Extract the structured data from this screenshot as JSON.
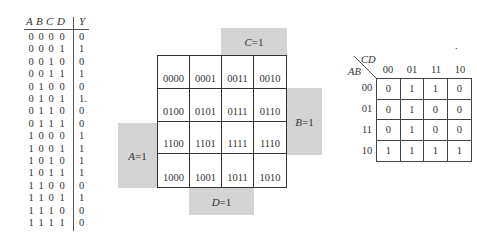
{
  "truth_table": {
    "headers": [
      "A",
      "B",
      "C",
      "D",
      "Y"
    ],
    "rows": [
      [
        "0",
        "0",
        "0",
        "0",
        "0"
      ],
      [
        "0",
        "0",
        "0",
        "1",
        "1"
      ],
      [
        "0",
        "0",
        "1",
        "0",
        "0"
      ],
      [
        "0",
        "0",
        "1",
        "1",
        "1"
      ],
      [
        "0",
        "1",
        "0",
        "0",
        "0"
      ],
      [
        "0",
        "1",
        "0",
        "1",
        "1."
      ],
      [
        "0",
        "1",
        "1",
        "0",
        "0"
      ],
      [
        "0",
        "1",
        "1",
        "1",
        "0"
      ],
      [
        "1",
        "0",
        "0",
        "0",
        "1"
      ],
      [
        "1",
        "0",
        "0",
        "1",
        "1"
      ],
      [
        "1",
        "0",
        "1",
        "0",
        "1"
      ],
      [
        "1",
        "0",
        "1",
        "1",
        "1"
      ],
      [
        "1",
        "1",
        "0",
        "0",
        "0"
      ],
      [
        "1",
        "1",
        "0",
        "1",
        "1"
      ],
      [
        "1",
        "1",
        "1",
        "0",
        "0"
      ],
      [
        "1",
        "1",
        "1",
        "1",
        "0"
      ]
    ]
  },
  "minterm_map": {
    "cells": [
      [
        "0000",
        "0001",
        "0011",
        "0010"
      ],
      [
        "0100",
        "0101",
        "0111",
        "0110"
      ],
      [
        "1100",
        "1101",
        "1111",
        "1110"
      ],
      [
        "1000",
        "1001",
        "1011",
        "1010"
      ]
    ],
    "regions": {
      "c": {
        "var": "C",
        "eq": "=1"
      },
      "b": {
        "var": "B",
        "eq": "=1"
      },
      "a": {
        "var": "A",
        "eq": "=1"
      },
      "d": {
        "var": "D",
        "eq": "=1"
      }
    }
  },
  "kmap": {
    "row_var": "AB",
    "col_var": "CD",
    "col_labels": [
      "00",
      "01",
      "11",
      "10"
    ],
    "row_labels": [
      "00",
      "01",
      "11",
      "10"
    ],
    "values": [
      [
        "0",
        "1",
        "1",
        "0"
      ],
      [
        "0",
        "1",
        "0",
        "0"
      ],
      [
        "0",
        "1",
        "0",
        "0"
      ],
      [
        "1",
        "1",
        "1",
        "1"
      ]
    ],
    "stray_mark": "."
  }
}
